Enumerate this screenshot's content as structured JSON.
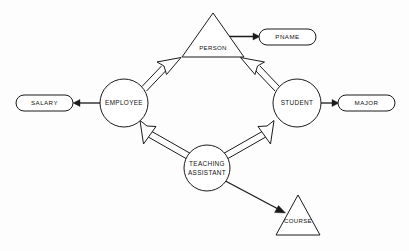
{
  "diagram": {
    "type": "entity-relationship-diagram",
    "colors": {
      "stroke": "#1a1a1a",
      "fill": "#ffffff",
      "background": "#fdfdfd"
    },
    "entities": [
      {
        "id": "employee",
        "label": "EMPLOYEE",
        "shape": "circle",
        "cx": 124,
        "cy": 103,
        "r": 24
      },
      {
        "id": "student",
        "label": "STUDENT",
        "shape": "circle",
        "cx": 297,
        "cy": 103,
        "r": 24
      },
      {
        "id": "teaching_assistant",
        "label_line1": "TEACHING",
        "label_line2": "ASSISTANT",
        "shape": "circle",
        "cx": 207,
        "cy": 168,
        "r": 23
      }
    ],
    "superclasses": [
      {
        "id": "person",
        "label": "PERSON",
        "shape": "triangle",
        "apex_x": 213,
        "apex_y": 13,
        "base_y": 57,
        "half_width": 31
      },
      {
        "id": "course",
        "label": "COURSE",
        "shape": "triangle",
        "apex_x": 298,
        "apex_y": 195,
        "base_y": 235,
        "half_width": 22
      }
    ],
    "attributes": [
      {
        "id": "pname",
        "label": "PNAME",
        "shape": "rounded-ellipse",
        "x": 259,
        "y": 29,
        "w": 57,
        "h": 16
      },
      {
        "id": "salary",
        "label": "SALARY",
        "shape": "rounded-ellipse",
        "x": 16,
        "y": 95,
        "w": 57,
        "h": 16
      },
      {
        "id": "major",
        "label": "MAJOR",
        "shape": "rounded-ellipse",
        "x": 338,
        "y": 95,
        "w": 57,
        "h": 16
      }
    ],
    "relationships": [
      {
        "id": "employee-isa-person",
        "from": "employee",
        "to": "person",
        "style": "double-line-hollow-arrow"
      },
      {
        "id": "student-isa-person",
        "from": "student",
        "to": "person",
        "style": "double-line-hollow-arrow"
      },
      {
        "id": "ta-isa-employee",
        "from": "teaching_assistant",
        "to": "employee",
        "style": "double-line-hollow-arrow"
      },
      {
        "id": "ta-isa-student",
        "from": "teaching_assistant",
        "to": "student",
        "style": "double-line-hollow-arrow"
      },
      {
        "id": "ta-to-course",
        "from": "teaching_assistant",
        "to": "course",
        "style": "solid-line-filled-arrow"
      },
      {
        "id": "person-to-pname",
        "from": "person",
        "to": "pname",
        "style": "solid-line-filled-arrow"
      },
      {
        "id": "employee-to-salary",
        "from": "employee",
        "to": "salary",
        "style": "solid-line-filled-arrow"
      },
      {
        "id": "student-to-major",
        "from": "student",
        "to": "major",
        "style": "solid-line-filled-arrow"
      }
    ]
  }
}
